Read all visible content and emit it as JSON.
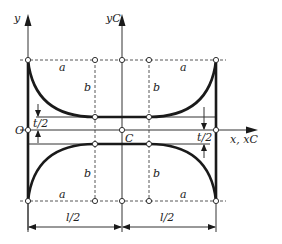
{
  "diagram": {
    "axes": {
      "y_label": "y",
      "yc_label": "yC",
      "x_label": "x, xC",
      "origin_label": "O",
      "centroid_label": "C"
    },
    "dimension_labels": {
      "a": "a",
      "b": "b",
      "t_half": "t/2",
      "l_half": "l/2"
    }
  }
}
